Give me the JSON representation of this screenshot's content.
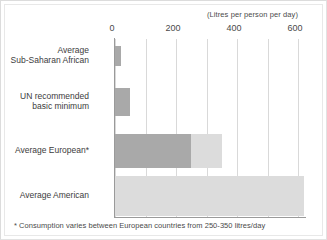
{
  "chart_data": {
    "type": "bar",
    "orientation": "horizontal",
    "title": "",
    "axis_title": "(Litres per person per day)",
    "xlabel": "",
    "ylabel": "",
    "xlim": [
      0,
      620
    ],
    "tick_labels": [
      "0",
      "200",
      "400",
      "600"
    ],
    "tick_values": [
      0,
      200,
      400,
      600
    ],
    "gridlines": [
      0,
      100,
      200,
      300,
      400,
      500,
      600
    ],
    "grid": true,
    "legend": "none",
    "categories": [
      "Average\nSub-Saharan African",
      "UN recommended\nbasic minimum",
      "Average European*",
      "Average American"
    ],
    "category_lines": [
      [
        "Average",
        "Sub-Saharan African"
      ],
      [
        "UN recommended",
        "basic minimum"
      ],
      [
        "Average European*"
      ],
      [
        "Average American"
      ]
    ],
    "values": [
      20,
      50,
      350,
      620
    ],
    "series": [
      {
        "name": "Consumption (lower estimate)",
        "color": "#a9a9a9",
        "values": [
          20,
          50,
          250,
          0
        ]
      },
      {
        "name": "Consumption (upper range)",
        "color": "#dcdcdc",
        "values": [
          20,
          50,
          350,
          620
        ]
      }
    ],
    "bars": [
      {
        "label": "Average Sub-Saharan African",
        "dark": 20,
        "light": 20,
        "note": ""
      },
      {
        "label": "UN recommended basic minimum",
        "dark": 50,
        "light": 50,
        "note": ""
      },
      {
        "label": "Average European*",
        "dark": 250,
        "light": 350,
        "note": "250-350 litres/day"
      },
      {
        "label": "Average American",
        "dark": 0,
        "light": 620,
        "note": ""
      }
    ],
    "annotations": [
      "* Consumption varies between European countries from 250-350 litres/day"
    ]
  },
  "footnote": "* Consumption varies between European countries from 250-350 litres/day",
  "colors": {
    "bar_dark": "#a9a9a9",
    "bar_light": "#dcdcdc",
    "gridline": "#d9d9d9",
    "axis": "#9a9a9a",
    "text": "#3c3c3c",
    "frame": "#e2e2e2",
    "background": "#ffffff"
  }
}
